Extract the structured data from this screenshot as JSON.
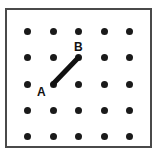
{
  "figure": {
    "title": "",
    "type": "dot-grid-with-segment",
    "background_color": "#ffffff",
    "border_color": "#4a4a4a",
    "dot_color": "#1a1a1a",
    "line_color": "#111111",
    "label_color": "#111111"
  },
  "grid": {
    "rows": 5,
    "cols": 5,
    "dot_radius_px": 3.5,
    "x_positions": [
      27,
      53,
      78,
      104,
      129
    ],
    "y_positions": [
      31,
      57,
      84,
      110,
      136
    ],
    "frame": {
      "x": 5,
      "y": 8,
      "width": 147,
      "height": 140,
      "border_width": 2
    }
  },
  "labels": [
    {
      "id": "A",
      "text": "A",
      "x": 37,
      "y": 86
    },
    {
      "id": "B",
      "text": "B",
      "x": 74,
      "y": 41
    }
  ],
  "segment": {
    "from": {
      "label": "A",
      "row": 3,
      "col": 2,
      "x": 53,
      "y": 84
    },
    "to": {
      "label": "B",
      "row": 2,
      "col": 3,
      "x": 78,
      "y": 58
    },
    "stroke_width": 5,
    "color": "#111111"
  }
}
